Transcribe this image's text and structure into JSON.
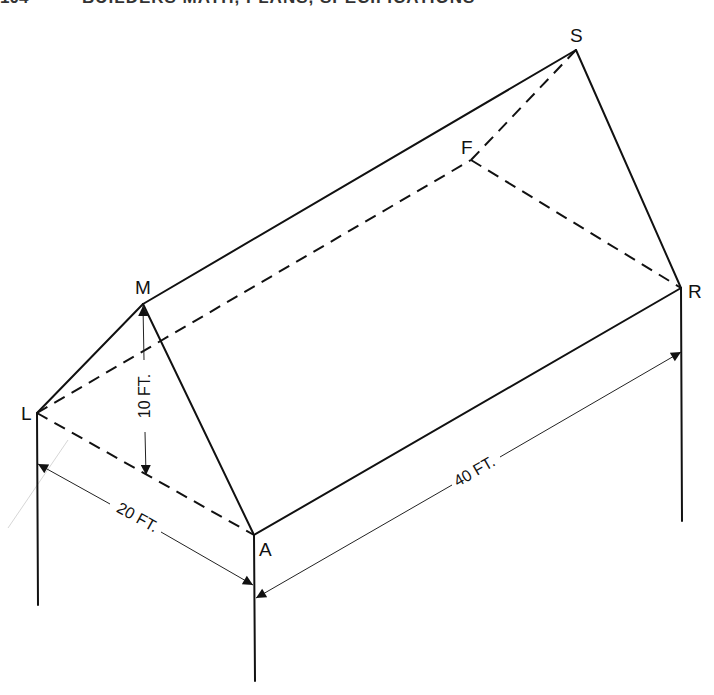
{
  "header": {
    "page_number": "104",
    "title": "BUILDERS MATH, PLANS, SPECIFICATIONS"
  },
  "diagram": {
    "type": "isometric roof drawing (gable/hip)",
    "points": {
      "L": "L",
      "M": "M",
      "A": "A",
      "S": "S",
      "F": "F",
      "R": "R"
    },
    "dimensions": {
      "height": "10 FT.",
      "width": "20 FT.",
      "length": "40 FT."
    },
    "edges": [
      {
        "from": "L",
        "to": "M",
        "style": "solid"
      },
      {
        "from": "M",
        "to": "A",
        "style": "solid"
      },
      {
        "from": "M",
        "to": "S",
        "style": "solid"
      },
      {
        "from": "S",
        "to": "R",
        "style": "solid"
      },
      {
        "from": "A",
        "to": "R",
        "style": "solid"
      },
      {
        "from": "L",
        "to": "A",
        "style": "dashed"
      },
      {
        "from": "L",
        "to": "F",
        "style": "dashed"
      },
      {
        "from": "F",
        "to": "S",
        "style": "dashed"
      },
      {
        "from": "F",
        "to": "R",
        "style": "dashed"
      }
    ]
  }
}
